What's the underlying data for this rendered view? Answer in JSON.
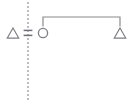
{
  "canvas": {
    "width": 135,
    "height": 106,
    "background": "#ffffff"
  },
  "diagram": {
    "type": "notation-diagram",
    "stroke_color": "#8a8a90",
    "stroke_color_dark": "#7a7a80",
    "stroke_width": 1.2,
    "elements": [
      {
        "id": "left-triangle",
        "symbol": "triangle",
        "glyph": "△",
        "label": "left-triangle",
        "cx": 13,
        "cy": 33,
        "size": 11
      },
      {
        "id": "equals-sign",
        "symbol": "equals",
        "glyph": "=",
        "label": "equals-sign",
        "cx": 28,
        "cy": 33,
        "size": 10
      },
      {
        "id": "circle-node",
        "symbol": "circle",
        "glyph": "○",
        "label": "circle",
        "cx": 43,
        "cy": 33,
        "size": 10
      },
      {
        "id": "right-triangle",
        "symbol": "triangle",
        "glyph": "△",
        "label": "right-triangle",
        "cx": 120,
        "cy": 33,
        "size": 11
      }
    ],
    "dashed_axis": {
      "id": "vertical-dashed-line",
      "label": "vertical-dashed-axis",
      "x": 28,
      "y_top": 2,
      "y_bottom": 101,
      "dash": "2 2"
    },
    "bracket": {
      "id": "span-bracket",
      "label": "horizontal-span-bracket",
      "x_left": 43,
      "x_right": 120,
      "y_top": 17,
      "leg_bottom": 26
    }
  }
}
